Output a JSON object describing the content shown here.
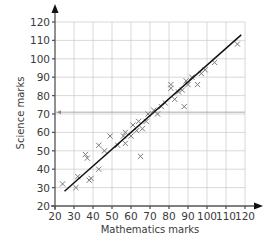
{
  "chart_data": {
    "type": "scatter",
    "title": "",
    "xlabel": "Mathematics marks",
    "ylabel": "Science marks",
    "xlim": [
      20,
      120
    ],
    "ylim": [
      20,
      120
    ],
    "xticks": [
      20,
      30,
      40,
      50,
      60,
      70,
      80,
      90,
      100,
      110,
      120
    ],
    "yticks": [
      20,
      30,
      40,
      50,
      60,
      70,
      80,
      90,
      100,
      110,
      120
    ],
    "grid": true,
    "marker": "x",
    "points": [
      {
        "x": 24,
        "y": 32
      },
      {
        "x": 31,
        "y": 30
      },
      {
        "x": 32,
        "y": 36
      },
      {
        "x": 36,
        "y": 48
      },
      {
        "x": 37,
        "y": 46
      },
      {
        "x": 38,
        "y": 34
      },
      {
        "x": 39,
        "y": 35
      },
      {
        "x": 43,
        "y": 40
      },
      {
        "x": 43,
        "y": 53
      },
      {
        "x": 46,
        "y": 50
      },
      {
        "x": 49,
        "y": 58
      },
      {
        "x": 53,
        "y": 53
      },
      {
        "x": 56,
        "y": 58
      },
      {
        "x": 57,
        "y": 60
      },
      {
        "x": 57,
        "y": 54
      },
      {
        "x": 60,
        "y": 58
      },
      {
        "x": 61,
        "y": 64
      },
      {
        "x": 63,
        "y": 61
      },
      {
        "x": 64,
        "y": 66
      },
      {
        "x": 65,
        "y": 47
      },
      {
        "x": 66,
        "y": 62
      },
      {
        "x": 68,
        "y": 66
      },
      {
        "x": 69,
        "y": 70
      },
      {
        "x": 72,
        "y": 72
      },
      {
        "x": 74,
        "y": 70
      },
      {
        "x": 76,
        "y": 74
      },
      {
        "x": 78,
        "y": 76
      },
      {
        "x": 81,
        "y": 84
      },
      {
        "x": 81,
        "y": 86
      },
      {
        "x": 83,
        "y": 78
      },
      {
        "x": 85,
        "y": 82
      },
      {
        "x": 87,
        "y": 83
      },
      {
        "x": 88,
        "y": 74
      },
      {
        "x": 89,
        "y": 88
      },
      {
        "x": 90,
        "y": 86
      },
      {
        "x": 92,
        "y": 90
      },
      {
        "x": 95,
        "y": 86
      },
      {
        "x": 97,
        "y": 92
      },
      {
        "x": 99,
        "y": 94
      },
      {
        "x": 104,
        "y": 98
      },
      {
        "x": 116,
        "y": 108
      }
    ],
    "best_fit_line": {
      "x1": 25,
      "y1": 28,
      "x2": 118,
      "y2": 113
    },
    "reading_line": {
      "y": 71,
      "direction": "left",
      "note": "horizontal guide with arrow pointing to y-axis"
    }
  },
  "axes": {
    "x_title": "Mathematics marks",
    "y_title": "Science marks"
  }
}
